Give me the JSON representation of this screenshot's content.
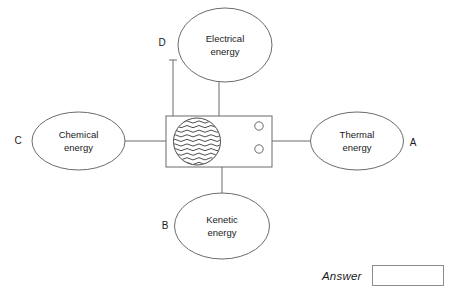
{
  "diagram": {
    "type": "energy-transfer-diagram",
    "central_device": {
      "name": "device-box",
      "contents": [
        "water-circle",
        "indicator-circle-top",
        "indicator-circle-bottom"
      ]
    },
    "nodes": [
      {
        "id": "electrical",
        "label_line1": "Electrical",
        "label_line2": "energy",
        "letter": "D",
        "position": "top"
      },
      {
        "id": "thermal",
        "label_line1": "Thermal",
        "label_line2": "energy",
        "letter": "A",
        "position": "right"
      },
      {
        "id": "kenetic",
        "label_line1": "Kenetic",
        "label_line2": "energy",
        "letter": "B",
        "position": "bottom"
      },
      {
        "id": "chemical",
        "label_line1": "Chemical",
        "label_line2": "energy",
        "letter": "C",
        "position": "left"
      }
    ]
  },
  "answer": {
    "label": "Answer",
    "value": "",
    "placeholder": ""
  },
  "colors": {
    "stroke": "#6b6b6b",
    "text": "#1a1a1a",
    "background": "#ffffff",
    "answer_box_border": "#8c8c8c"
  }
}
